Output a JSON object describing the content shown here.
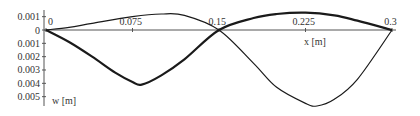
{
  "chart_data": {
    "type": "line",
    "title": "",
    "xlabel": "x [m]",
    "ylabel": "w [m]",
    "xlim": [
      0,
      0.3
    ],
    "ylim": [
      -0.001,
      0.0055
    ],
    "y_axis_inverted": true,
    "grid": false,
    "legend": null,
    "x_ticks": [
      "0",
      "0.075",
      "0.15",
      "0.225",
      "0.3"
    ],
    "y_ticks": [
      "0.001",
      "0",
      "0.001",
      "0.002",
      "0.003",
      "0.004",
      "0.005"
    ],
    "series": [
      {
        "name": "mode-1 (thick)",
        "x": [
          0,
          0.02,
          0.04,
          0.06,
          0.075,
          0.083,
          0.1,
          0.12,
          0.15,
          0.18,
          0.2,
          0.225,
          0.25,
          0.27,
          0.3
        ],
        "values": [
          0,
          0.0009,
          0.002,
          0.0032,
          0.0039,
          0.0041,
          0.0034,
          0.0022,
          0,
          -0.0009,
          -0.0012,
          -0.0013,
          -0.0011,
          -0.0007,
          0
        ]
      },
      {
        "name": "mode-2 (thin)",
        "x": [
          0,
          0.02,
          0.04,
          0.075,
          0.1,
          0.12,
          0.15,
          0.18,
          0.2,
          0.225,
          0.235,
          0.25,
          0.27,
          0.3
        ],
        "values": [
          0,
          -0.0002,
          -0.0005,
          -0.001,
          -0.0012,
          -0.0011,
          0,
          0.0025,
          0.0043,
          0.0055,
          0.0057,
          0.0052,
          0.0037,
          0
        ]
      }
    ]
  },
  "axes": {
    "x_title": "x [m]",
    "y_title": "w [m]"
  }
}
